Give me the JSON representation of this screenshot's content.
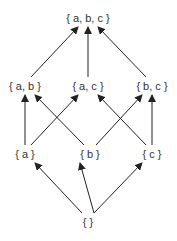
{
  "diagram": {
    "title": "",
    "type": "hasse-diagram",
    "line_color": "#222222",
    "text_color": "#333333",
    "nodes": [
      {
        "id": "abc",
        "label": "{ a, b, c }",
        "x": 88,
        "y": 18
      },
      {
        "id": "ab",
        "label": "{ a, b }",
        "x": 25,
        "y": 86
      },
      {
        "id": "ac",
        "label": "{ a, c }",
        "x": 88,
        "y": 86
      },
      {
        "id": "bc",
        "label": "{ b, c }",
        "x": 152,
        "y": 86
      },
      {
        "id": "a",
        "label": "{ a }",
        "x": 25,
        "y": 154
      },
      {
        "id": "b",
        "label": "{ b }",
        "x": 90,
        "y": 154
      },
      {
        "id": "c",
        "label": "{ c }",
        "x": 152,
        "y": 154
      },
      {
        "id": "empty",
        "label": "{ }",
        "x": 88,
        "y": 222
      }
    ],
    "edges": [
      {
        "from": "empty",
        "to": "a"
      },
      {
        "from": "empty",
        "to": "b"
      },
      {
        "from": "empty",
        "to": "c"
      },
      {
        "from": "a",
        "to": "ab"
      },
      {
        "from": "a",
        "to": "ac"
      },
      {
        "from": "b",
        "to": "ab"
      },
      {
        "from": "b",
        "to": "bc"
      },
      {
        "from": "c",
        "to": "ac"
      },
      {
        "from": "c",
        "to": "bc"
      },
      {
        "from": "ab",
        "to": "abc"
      },
      {
        "from": "ac",
        "to": "abc"
      },
      {
        "from": "bc",
        "to": "abc"
      }
    ]
  }
}
